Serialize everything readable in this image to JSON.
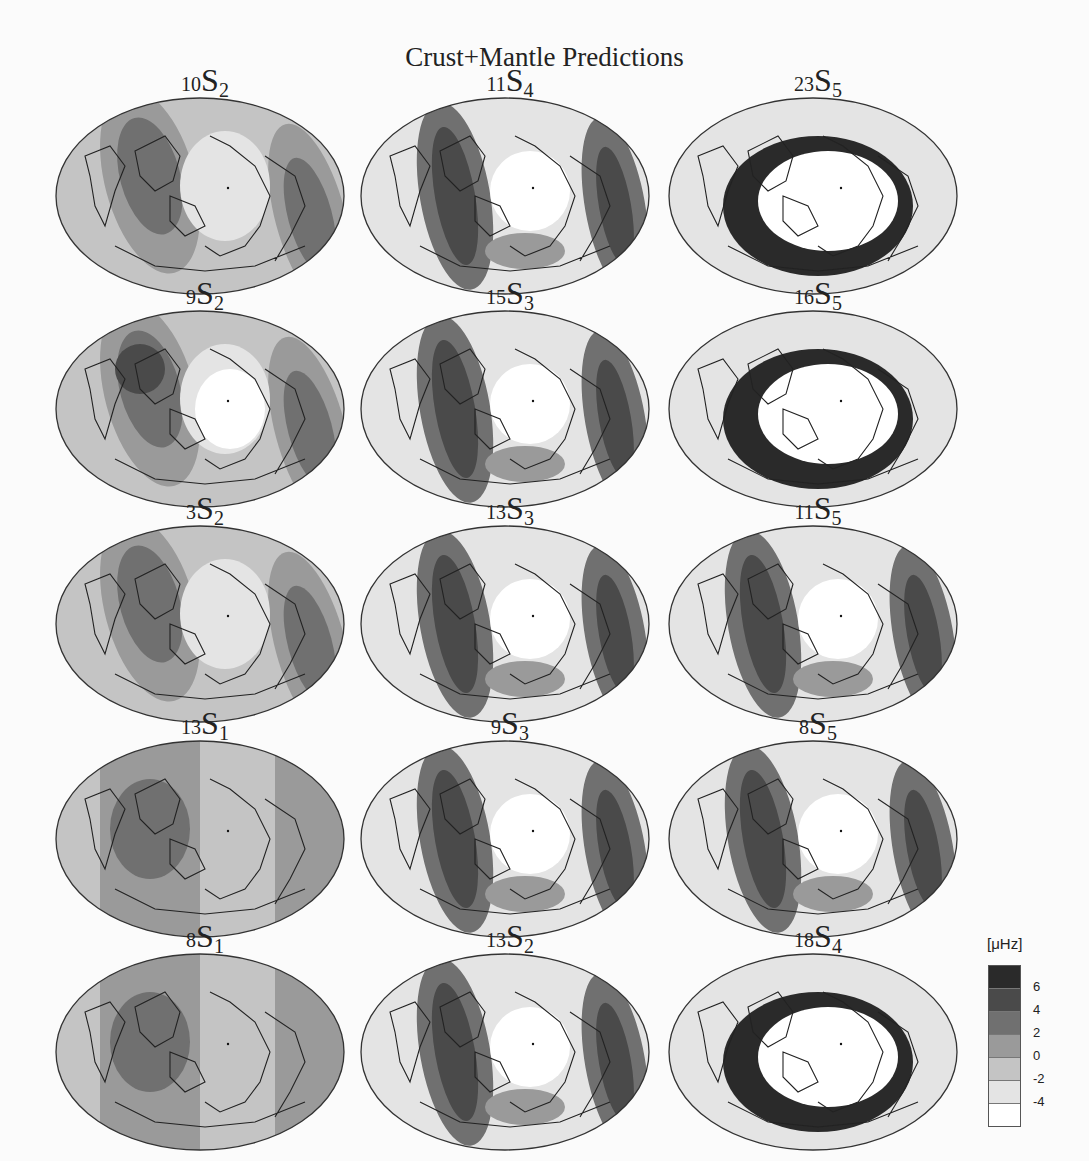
{
  "title": "Crust+Mantle Predictions",
  "panels": [
    {
      "n": "10",
      "l": "2",
      "row": 0,
      "col": 0,
      "pattern": "deg2a"
    },
    {
      "n": "11",
      "l": "4",
      "row": 0,
      "col": 1,
      "pattern": "deg4"
    },
    {
      "n": "23",
      "l": "5",
      "row": 0,
      "col": 2,
      "pattern": "ring"
    },
    {
      "n": "9",
      "l": "2",
      "row": 1,
      "col": 0,
      "pattern": "deg2b"
    },
    {
      "n": "15",
      "l": "3",
      "row": 1,
      "col": 1,
      "pattern": "deg3"
    },
    {
      "n": "16",
      "l": "5",
      "row": 1,
      "col": 2,
      "pattern": "ring"
    },
    {
      "n": "3",
      "l": "2",
      "row": 2,
      "col": 0,
      "pattern": "deg2c"
    },
    {
      "n": "13",
      "l": "3",
      "row": 2,
      "col": 1,
      "pattern": "deg3"
    },
    {
      "n": "11",
      "l": "5",
      "row": 2,
      "col": 2,
      "pattern": "deg5"
    },
    {
      "n": "13",
      "l": "1",
      "row": 3,
      "col": 0,
      "pattern": "deg1"
    },
    {
      "n": "9",
      "l": "3",
      "row": 3,
      "col": 1,
      "pattern": "deg3"
    },
    {
      "n": "8",
      "l": "5",
      "row": 3,
      "col": 2,
      "pattern": "deg5"
    },
    {
      "n": "8",
      "l": "1",
      "row": 4,
      "col": 0,
      "pattern": "deg1b"
    },
    {
      "n": "13",
      "l": "2",
      "row": 4,
      "col": 1,
      "pattern": "deg4"
    },
    {
      "n": "18",
      "l": "4",
      "row": 4,
      "col": 2,
      "pattern": "ring"
    }
  ],
  "legend": {
    "unit": "[μHz]",
    "ticks": [
      "6",
      "4",
      "2",
      "0",
      "-2",
      "-4"
    ],
    "colors": [
      "#2a2a2a",
      "#4a4a4a",
      "#707070",
      "#9a9a9a",
      "#c4c4c4",
      "#e4e4e4",
      "#ffffff"
    ]
  },
  "chart_data": {
    "type": "heatmap",
    "title": "Crust+Mantle Predictions",
    "subplots": [
      "10S2",
      "11S4",
      "23S5",
      "9S2",
      "15S3",
      "16S5",
      "3S2",
      "13S3",
      "11S5",
      "13S1",
      "9S3",
      "8S5",
      "8S1",
      "13S2",
      "18S4"
    ],
    "projection": "Hammer/Mollweide global map with plate boundaries and coastlines",
    "colorbar": {
      "label": "[μHz]",
      "ticks": [
        6,
        4,
        2,
        0,
        -2,
        -4
      ],
      "levels": 7,
      "scale": "grayscale, dark = high"
    }
  }
}
